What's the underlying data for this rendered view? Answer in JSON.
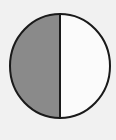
{
  "diagram": {
    "type": "fraction-circle",
    "parts_total": 2,
    "parts_shaded": 1,
    "shaded_side": "left",
    "fraction": "1/2",
    "colors": {
      "background": "#f1f1f1",
      "shaded": "#8a8a8a",
      "unshaded": "#fbfbfb",
      "stroke": "#1a1a1a"
    },
    "geometry": {
      "cx": 60,
      "cy": 66,
      "rx": 50,
      "ry": 52,
      "stroke_width": 2
    }
  }
}
